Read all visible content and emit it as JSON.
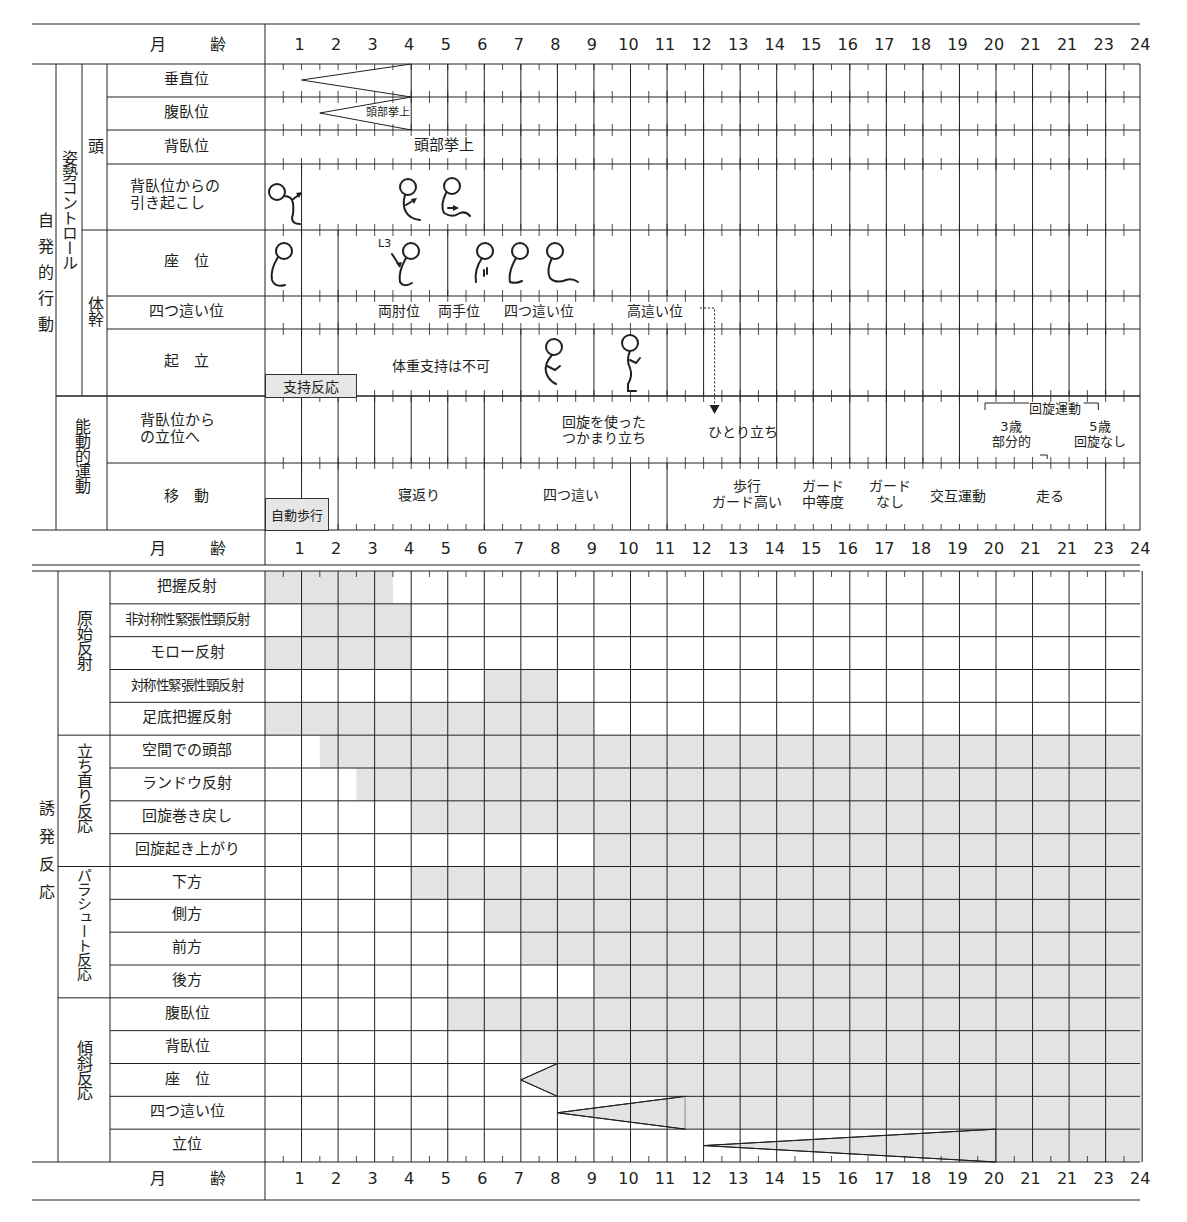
{
  "header": {
    "age_label": "月　齢"
  },
  "months": [
    "1",
    "2",
    "3",
    "4",
    "5",
    "6",
    "7",
    "8",
    "9",
    "10",
    "11",
    "12",
    "13",
    "14",
    "15",
    "16",
    "17",
    "18",
    "19",
    "20",
    "21",
    "21",
    "23",
    "24"
  ],
  "colors": {
    "shade": "#e3e3e3",
    "line": "#231f20",
    "box": "#e6e6e6"
  },
  "top_section": {
    "label": "自発的行動",
    "group_posture": "姿勢コントロール",
    "group_head": "頭",
    "group_trunk": "体幹",
    "group_active": "能動的運動",
    "rows": [
      {
        "label": "垂直位"
      },
      {
        "label": "腹臥位",
        "annotation": "頭部挙上"
      },
      {
        "label": "背臥位",
        "annotation": "頭部挙上"
      },
      {
        "label": "背臥位からの\n引き起こし"
      },
      {
        "label": "座　位",
        "annotation": "L3"
      },
      {
        "label": "四つ這い位",
        "annotations": [
          "両肘位",
          "両手位",
          "四つ這い位",
          "高這い位"
        ]
      },
      {
        "label": "起　立",
        "box": "支持反応",
        "annotation": "体重支持は不可"
      },
      {
        "label": "背臥位から\nの立位へ",
        "annotations": [
          "回旋を使った\nつかまり立ち",
          "ひとり立ち",
          "回旋運動",
          "3歳\n部分的",
          "5歳\n回旋なし"
        ]
      },
      {
        "label": "移　動",
        "box": "自動歩行",
        "annotations": [
          "寝返り",
          "四つ這い",
          "歩行\nガード高い",
          "ガード\n中等度",
          "ガード\nなし",
          "交互運動",
          "走る"
        ]
      }
    ]
  },
  "bottom_section": {
    "label": "誘発反応",
    "groups": [
      "原始反射",
      "立ち直り反応",
      "パラシュート反応",
      "傾斜反応"
    ]
  },
  "chart_data": {
    "type": "table",
    "title": "",
    "xlabel": "月齢",
    "x": [
      "1",
      "2",
      "3",
      "4",
      "5",
      "6",
      "7",
      "8",
      "9",
      "10",
      "11",
      "12",
      "13",
      "14",
      "15",
      "16",
      "17",
      "18",
      "19",
      "20",
      "21",
      "21",
      "23",
      "24"
    ],
    "xlim": [
      0,
      24
    ],
    "series": [
      {
        "group": "原始反射",
        "name": "把握反射",
        "start": 0,
        "end": 3.5
      },
      {
        "group": "原始反射",
        "name": "非対称性緊張性頸反射",
        "start": 1,
        "end": 4
      },
      {
        "group": "原始反射",
        "name": "モロー反射",
        "start": 0,
        "end": 4
      },
      {
        "group": "原始反射",
        "name": "対称性緊張性頸反射",
        "start": 6,
        "end": 8
      },
      {
        "group": "原始反射",
        "name": "足底把握反射",
        "start": 0,
        "end": 9
      },
      {
        "group": "立ち直り反応",
        "name": "空間での頭部",
        "start": 1.5,
        "end": 24
      },
      {
        "group": "立ち直り反応",
        "name": "ランドウ反射",
        "start": 2.5,
        "end": 24
      },
      {
        "group": "立ち直り反応",
        "name": "回旋巻き戻し",
        "start": 4,
        "end": 24
      },
      {
        "group": "立ち直り反応",
        "name": "回旋起き上がり",
        "start": 9,
        "end": 24
      },
      {
        "group": "パラシュート反応",
        "name": "下方",
        "start": 4,
        "end": 24
      },
      {
        "group": "パラシュート反応",
        "name": "側方",
        "start": 6,
        "end": 24
      },
      {
        "group": "パラシュート反応",
        "name": "前方",
        "start": 7,
        "end": 24
      },
      {
        "group": "パラシュート反応",
        "name": "後方",
        "start": 9,
        "end": 24
      },
      {
        "group": "傾斜反応",
        "name": "腹臥位",
        "start": 5,
        "end": 24
      },
      {
        "group": "傾斜反応",
        "name": "背臥位",
        "start": 7,
        "end": 24
      },
      {
        "group": "傾斜反応",
        "name": "座　位",
        "taper_start": 7,
        "start": 8,
        "end": 24
      },
      {
        "group": "傾斜反応",
        "name": "四つ這い位",
        "taper_start": 8,
        "start": 11.5,
        "end": 24
      },
      {
        "group": "傾斜反応",
        "name": "立位",
        "taper_start": 12,
        "start": 20,
        "end": 24
      }
    ],
    "top_wedges": [
      {
        "name": "垂直位",
        "taper_start": 1,
        "end": 4
      },
      {
        "name": "腹臥位",
        "taper_start": 1.5,
        "end": 4,
        "label": "頭部挙上"
      }
    ]
  }
}
